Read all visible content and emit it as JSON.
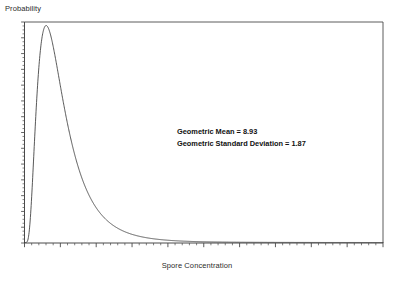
{
  "chart_data": {
    "type": "line",
    "title": "",
    "subtitle": "",
    "xlabel": "Spore Concentration",
    "ylabel": "Probability",
    "grid": false,
    "legend": null,
    "legend_position": "none",
    "axis": {
      "x_range": [
        0,
        100
      ],
      "y_range": [
        0,
        1
      ],
      "x_tick_labels": [],
      "y_tick_labels": [],
      "x_major_ticks": 11,
      "x_minor_ticks_per_major": 5,
      "y_minor_ticks": 56,
      "tick_direction": "out"
    },
    "distribution": "lognormal",
    "geometric_mean": 8.93,
    "geometric_standard_deviation": 1.87,
    "line_color": "#3a3a3a",
    "line_width": 0.8,
    "annotations": [
      "Geometric Mean = 8.93",
      "Geometric Standard Deviation = 1.87"
    ],
    "x": [
      0.0,
      0.5,
      1.0,
      1.5,
      2.0,
      2.5,
      3.0,
      3.5,
      4.0,
      4.5,
      5.0,
      6.0,
      7.0,
      8.0,
      9.0,
      10.0,
      12.0,
      14.0,
      16.0,
      18.0,
      20.0,
      25.0,
      30.0,
      35.0,
      40.0,
      50.0,
      60.0,
      70.0,
      80.0,
      90.0,
      100.0
    ],
    "y": [
      0.0,
      1.0,
      0.86,
      0.63,
      0.47,
      0.37,
      0.3,
      0.25,
      0.215,
      0.187,
      0.165,
      0.131,
      0.107,
      0.09,
      0.077,
      0.067,
      0.052,
      0.042,
      0.035,
      0.029,
      0.025,
      0.018,
      0.0135,
      0.0105,
      0.0085,
      0.0058,
      0.0042,
      0.0032,
      0.0025,
      0.002,
      0.0016
    ]
  },
  "chart": {
    "ylabel": "Probability",
    "xlabel": "Spore Concentration",
    "annotation_line_1": "Geometric Mean = 8.93",
    "annotation_line_2": "Geometric Standard Deviation = 1.87",
    "colors": {
      "frame": "#4a4a4a",
      "curve": "#3a3a3a",
      "text": "#2b2b2b"
    }
  }
}
